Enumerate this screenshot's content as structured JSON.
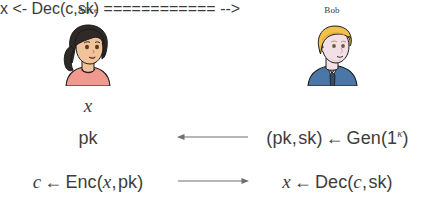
{
  "diagram": {
    "parties": [
      {
        "id": "alice",
        "name": "Alice",
        "avatar": "alice-avatar"
      },
      {
        "id": "bob",
        "name": "Bob",
        "avatar": "bob-avatar"
      }
    ],
    "colors": {
      "text": "#3d3d3d",
      "outline": "#1a1a1a",
      "arrow": "#6f6f6f",
      "alice_hair": "#2f2a28",
      "alice_skin": "#f0c39a",
      "alice_shirt": "#f0998f",
      "bob_hair": "#f2c04c",
      "bob_skin": "#f3e0e6",
      "bob_suit": "#4a77a8",
      "bob_shirt": "#ffffff",
      "bob_tie": "#3c4a63"
    },
    "rows": [
      {
        "id": "row-x",
        "left": {
          "parts": [
            {
              "style": "italic",
              "text": "x"
            }
          ]
        },
        "channel": null,
        "right": {
          "parts": []
        }
      },
      {
        "id": "row-pk",
        "left": {
          "parts": [
            {
              "style": "upright",
              "text": "pk"
            }
          ]
        },
        "channel": {
          "direction": "left",
          "name": "arrow-left-pk"
        },
        "right": {
          "parts": [
            {
              "style": "punct",
              "text": "("
            },
            {
              "style": "upright",
              "text": "pk"
            },
            {
              "style": "comma",
              "text": ","
            },
            {
              "style": "upright",
              "text": "sk"
            },
            {
              "style": "punct",
              "text": ")"
            },
            {
              "style": "arrow",
              "text": "←"
            },
            {
              "style": "upright",
              "text": "Gen"
            },
            {
              "style": "punct",
              "text": "("
            },
            {
              "style": "upright",
              "text": "1"
            },
            {
              "style": "super",
              "text": "κ"
            },
            {
              "style": "punct",
              "text": ")"
            }
          ]
        }
      },
      {
        "id": "row-enc",
        "left": {
          "parts": [
            {
              "style": "italic",
              "text": "c"
            },
            {
              "style": "arrow",
              "text": "←"
            },
            {
              "style": "upright",
              "text": "Enc"
            },
            {
              "style": "punct",
              "text": "("
            },
            {
              "style": "italic",
              "text": "x"
            },
            {
              "style": "comma",
              "text": ","
            },
            {
              "style": "upright",
              "text": "pk"
            },
            {
              "style": "punct",
              "text": ")"
            }
          ]
        },
        "channel": {
          "direction": "right",
          "name": "arrow-right-c"
        },
        "right": {
          "parts": [
            {
              "style": "italic",
              "text": "x"
            },
            {
              "style": "arrow",
              "text": "←"
            },
            {
              "style": "upright",
              "text": "Dec"
            },
            {
              "style": "punct",
              "text": "("
            },
            {
              "style": "italic",
              "text": "c"
            },
            {
              "style": "comma",
              "text": ","
            },
            {
              "style": "upright",
              "text": "sk"
            },
            {
              "style": "punct",
              "text": ")"
            }
          ]
        }
      }
    ],
    "plain_text": {
      "alice_input": "x",
      "alice_pk": "pk",
      "bob_keygen": "(pk, sk) ← Gen(1κ)",
      "alice_encrypt": "c ← Enc(x, pk)",
      "bob_decrypt": "x ← Dec(c, sk)"
    }
  }
}
